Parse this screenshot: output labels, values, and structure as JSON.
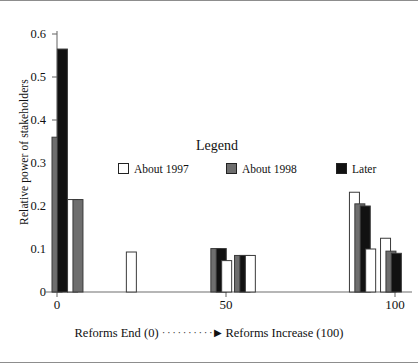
{
  "chart_data": {
    "type": "bar",
    "title": "",
    "xlabel_left": "Reforms End (0)",
    "xlabel_right": "Reforms Increase (100)",
    "ylabel": "Relative power of stakeholders",
    "xlim": [
      -3,
      106
    ],
    "ylim": [
      0,
      0.6
    ],
    "xticks": [
      0,
      50,
      100
    ],
    "xticklabels": [
      "0",
      "50",
      "100"
    ],
    "yticks": [
      0,
      0.1,
      0.2,
      0.3,
      0.4,
      0.5,
      0.6
    ],
    "yticklabels": [
      "0",
      "0.1",
      "0.2",
      "0.3",
      "0.4",
      "0.5",
      "0.6"
    ],
    "grid": false,
    "legend_title": "Legend",
    "series": [
      {
        "name": "About 1997",
        "color": "#ffffff"
      },
      {
        "name": "About 1998",
        "color": "#6e6e6e"
      },
      {
        "name": "Later",
        "color": "#111111"
      }
    ],
    "bars": [
      {
        "x": 0.0,
        "value": 0.36,
        "series": "About 1998"
      },
      {
        "x": 1.6,
        "value": 0.565,
        "series": "Later"
      },
      {
        "x": 4.6,
        "value": 0.215,
        "series": "About 1997"
      },
      {
        "x": 6.2,
        "value": 0.215,
        "series": "About 1998"
      },
      {
        "x": 22.0,
        "value": 0.093,
        "series": "About 1997"
      },
      {
        "x": 47.0,
        "value": 0.101,
        "series": "About 1998"
      },
      {
        "x": 48.6,
        "value": 0.101,
        "series": "Later"
      },
      {
        "x": 50.2,
        "value": 0.073,
        "series": "About 1997"
      },
      {
        "x": 54.0,
        "value": 0.085,
        "series": "About 1998"
      },
      {
        "x": 55.6,
        "value": 0.085,
        "series": "Later"
      },
      {
        "x": 57.2,
        "value": 0.085,
        "series": "About 1997"
      },
      {
        "x": 88.0,
        "value": 0.232,
        "series": "About 1997"
      },
      {
        "x": 89.6,
        "value": 0.205,
        "series": "About 1998"
      },
      {
        "x": 91.2,
        "value": 0.2,
        "series": "Later"
      },
      {
        "x": 92.8,
        "value": 0.1,
        "series": "About 1997"
      },
      {
        "x": 97.2,
        "value": 0.125,
        "series": "About 1997"
      },
      {
        "x": 98.8,
        "value": 0.095,
        "series": "About 1998"
      },
      {
        "x": 100.4,
        "value": 0.09,
        "series": "Later"
      }
    ]
  },
  "axis": {
    "ylabel": "Relative power of stakeholders",
    "ytick_0": "0",
    "ytick_1": "0.1",
    "ytick_2": "0.2",
    "ytick_3": "0.3",
    "ytick_4": "0.4",
    "ytick_5": "0.5",
    "ytick_6": "0.6",
    "xtick_0": "0",
    "xtick_1": "50",
    "xtick_2": "100",
    "xtitle_left": "Reforms End (0)",
    "xtitle_dots": "··········",
    "xtitle_arrow": "▶",
    "xtitle_right": "Reforms Increase (100)"
  },
  "legend": {
    "title": "Legend",
    "items": [
      {
        "label": "About 1997",
        "color": "#ffffff"
      },
      {
        "label": "About 1998",
        "color": "#6e6e6e"
      },
      {
        "label": "Later",
        "color": "#111111"
      }
    ]
  }
}
